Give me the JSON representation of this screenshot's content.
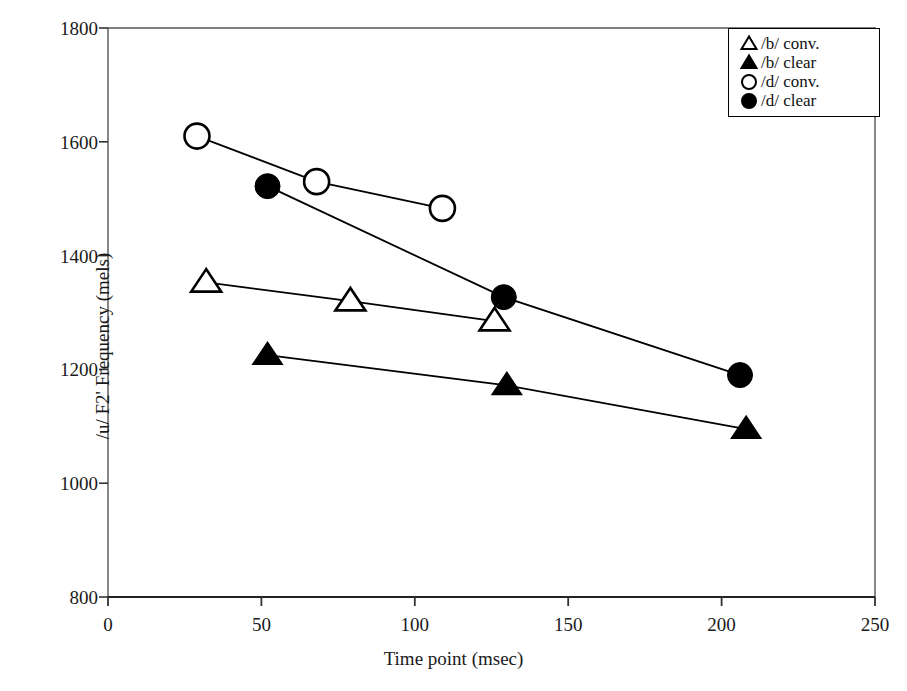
{
  "chart_data": {
    "type": "line",
    "title": "",
    "xlabel": "Time point (msec)",
    "ylabel": "/u/ F2' Frequency (mels)",
    "xlim": [
      0,
      250
    ],
    "ylim": [
      800,
      1800
    ],
    "xticks": [
      0,
      50,
      100,
      150,
      200,
      250
    ],
    "yticks": [
      800,
      1000,
      1200,
      1400,
      1600,
      1800
    ],
    "grid": false,
    "legend_position": "top-right",
    "series": [
      {
        "name": "/b/ conv.",
        "marker": "open-triangle",
        "color": "#000000",
        "x": [
          32,
          79,
          126
        ],
        "y": [
          1353,
          1320,
          1285
        ]
      },
      {
        "name": "/b/ clear",
        "marker": "filled-triangle",
        "color": "#000000",
        "x": [
          52,
          130,
          208
        ],
        "y": [
          1225,
          1172,
          1095
        ]
      },
      {
        "name": "/d/ conv.",
        "marker": "open-circle",
        "color": "#000000",
        "x": [
          29,
          68,
          109
        ],
        "y": [
          1610,
          1530,
          1483
        ]
      },
      {
        "name": "/d/ clear",
        "marker": "filled-circle",
        "color": "#000000",
        "x": [
          52,
          129,
          206
        ],
        "y": [
          1522,
          1327,
          1190
        ]
      }
    ]
  },
  "axes": {
    "y_title": "/u/ F2' Frequency (mels)",
    "x_title": "Time point (msec)",
    "y_tick_labels": [
      "1800",
      "1600",
      "1400",
      "1200",
      "1000",
      "800"
    ],
    "x_tick_labels": [
      "0",
      "50",
      "100",
      "150",
      "200",
      "250"
    ]
  },
  "legend": {
    "items": [
      {
        "label": "/b/ conv.",
        "marker": "open-triangle-icon"
      },
      {
        "label": "/b/ clear",
        "marker": "filled-triangle-icon"
      },
      {
        "label": "/d/ conv.",
        "marker": "open-circle-icon"
      },
      {
        "label": "/d/ clear",
        "marker": "filled-circle-icon"
      }
    ]
  }
}
